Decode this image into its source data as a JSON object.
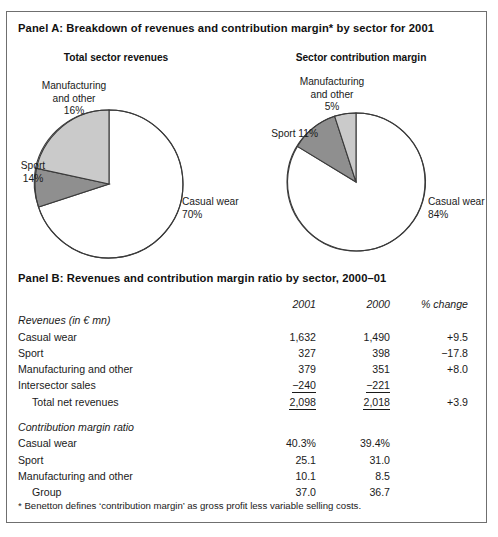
{
  "top_artifact": "",
  "panelA": {
    "title": "Panel A: Breakdown of revenues and contribution margin* by sector for 2001",
    "chart_left_title": "Total sector revenues",
    "chart_right_title": "Sector contribution margin",
    "left_labels": {
      "manufacturing": "Manufacturing\nand other\n16%",
      "sport": "Sport\n14%",
      "casual": "Casual wear\n70%"
    },
    "right_labels": {
      "manufacturing": "Manufacturing\nand other\n5%",
      "sport": "Sport 11%",
      "casual": "Casual wear\n84%"
    }
  },
  "panelB": {
    "title": "Panel B: Revenues and contribution margin ratio by sector, 2000–01",
    "columns": [
      "",
      "2001",
      "2000",
      "% change"
    ],
    "section1_title": "Revenues (in € mn)",
    "section1_rows": [
      {
        "label": "Casual wear",
        "indent": false,
        "v2001": "1,632",
        "v2000": "1,490",
        "change": "+9.5",
        "underline": false
      },
      {
        "label": "Sport",
        "indent": false,
        "v2001": "327",
        "v2000": "398",
        "change": "−17.8",
        "underline": false
      },
      {
        "label": "Manufacturing and other",
        "indent": false,
        "v2001": "379",
        "v2000": "351",
        "change": "+8.0",
        "underline": false
      },
      {
        "label": "Intersector sales",
        "indent": false,
        "v2001": "−240",
        "v2000": "−221",
        "change": "",
        "underline": true
      },
      {
        "label": "Total net revenues",
        "indent": true,
        "v2001": "2,098",
        "v2000": "2,018",
        "change": "+3.9",
        "underline": true
      }
    ],
    "section2_title": "Contribution margin ratio",
    "section2_rows": [
      {
        "label": "Casual wear",
        "indent": false,
        "v2001": "40.3%",
        "v2000": "39.4%",
        "change": "",
        "underline": false
      },
      {
        "label": "Sport",
        "indent": false,
        "v2001": "25.1",
        "v2000": "31.0",
        "change": "",
        "underline": false
      },
      {
        "label": "Manufacturing and other",
        "indent": false,
        "v2001": "10.1",
        "v2000": "8.5",
        "change": "",
        "underline": false
      },
      {
        "label": "Group",
        "indent": true,
        "v2001": "37.0",
        "v2000": "36.7",
        "change": "",
        "underline": false
      }
    ]
  },
  "footnote": "* Benetton defines ‘contribution margin’ as gross profit less variable selling costs.",
  "colors": {
    "casual": "#ffffff",
    "sport": "#8f8f8f",
    "manufacturing": "#cacaca",
    "outline": "#3a3a3a",
    "frame": "#6f6f6f",
    "text": "#1a1a1a"
  },
  "chart_data": [
    {
      "type": "pie",
      "title": "Total sector revenues",
      "categories": [
        "Casual wear",
        "Sport",
        "Manufacturing and other"
      ],
      "values": [
        70,
        14,
        16
      ],
      "unit": "%",
      "labels": [
        "Casual wear 70%",
        "Sport 14%",
        "Manufacturing and other 16%"
      ],
      "colors": [
        "#ffffff",
        "#8f8f8f",
        "#cacaca"
      ],
      "legend": "none",
      "start_angle_deg": 0,
      "direction": "clockwise"
    },
    {
      "type": "pie",
      "title": "Sector contribution margin",
      "categories": [
        "Casual wear",
        "Sport",
        "Manufacturing and other"
      ],
      "values": [
        84,
        11,
        5
      ],
      "unit": "%",
      "labels": [
        "Casual wear 84%",
        "Sport 11%",
        "Manufacturing and other 5%"
      ],
      "colors": [
        "#ffffff",
        "#8f8f8f",
        "#cacaca"
      ],
      "legend": "none",
      "start_angle_deg": 0,
      "direction": "clockwise"
    },
    {
      "type": "table",
      "title": "Panel B: Revenues and contribution margin ratio by sector, 2000-01",
      "columns": [
        "",
        "2001",
        "2000",
        "% change"
      ],
      "rows": [
        [
          "Revenues (in € mn)",
          "",
          "",
          ""
        ],
        [
          "Casual wear",
          "1,632",
          "1,490",
          "+9.5"
        ],
        [
          "Sport",
          "327",
          "398",
          "-17.8"
        ],
        [
          "Manufacturing and other",
          "379",
          "351",
          "+8.0"
        ],
        [
          "Intersector sales",
          "-240",
          "-221",
          ""
        ],
        [
          "Total net revenues",
          "2,098",
          "2,018",
          "+3.9"
        ],
        [
          "Contribution margin ratio",
          "",
          "",
          ""
        ],
        [
          "Casual wear",
          "40.3%",
          "39.4%",
          ""
        ],
        [
          "Sport",
          "25.1",
          "31.0",
          ""
        ],
        [
          "Manufacturing and other",
          "10.1",
          "8.5",
          ""
        ],
        [
          "Group",
          "37.0",
          "36.7",
          ""
        ]
      ]
    }
  ]
}
